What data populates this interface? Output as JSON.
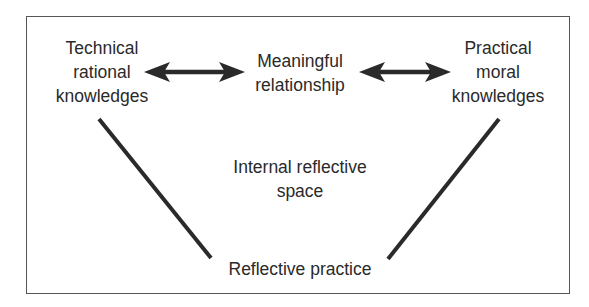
{
  "diagram": {
    "title": "",
    "nodes": {
      "technical": {
        "lines": [
          "Technical",
          "rational",
          "knowledges"
        ]
      },
      "meaningful": {
        "lines": [
          "Meaningful",
          "relationship"
        ]
      },
      "practical": {
        "lines": [
          "Practical",
          "moral",
          "knowledges"
        ]
      },
      "internal": {
        "lines": [
          "Internal reflective",
          "space"
        ]
      },
      "reflective": {
        "lines": [
          "Reflective practice"
        ]
      }
    },
    "edges": [
      {
        "from": "technical",
        "to": "meaningful",
        "type": "double-arrow"
      },
      {
        "from": "meaningful",
        "to": "practical",
        "type": "double-arrow"
      },
      {
        "from": "technical",
        "to": "reflective",
        "type": "line"
      },
      {
        "from": "practical",
        "to": "reflective",
        "type": "line"
      }
    ],
    "colors": {
      "stroke": "#2a2a2a",
      "frame": "#555555",
      "background": "#ffffff"
    }
  }
}
